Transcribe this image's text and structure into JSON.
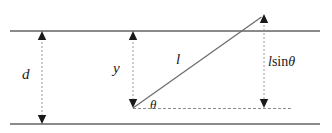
{
  "diagram": {
    "type": "geometry-diagram",
    "background_color": "#ffffff",
    "stroke_color": "#7a7a7a",
    "dashed_color": "#8c8c8c",
    "needle_color": "#6e6e6e",
    "text_color": "#1a1a1a",
    "labels": {
      "line_spacing": "d",
      "vertical_offset": "y",
      "needle_length": "l",
      "angle": "θ",
      "vertical_component_symbol": "l",
      "vertical_component_operator": "sin",
      "vertical_component_angle": "θ",
      "vertical_component": "l sin θ"
    },
    "elements": {
      "top_line": {
        "name": "top-parallel-line",
        "x1": 10,
        "y1": 31,
        "x2": 320,
        "y2": 31
      },
      "bottom_line": {
        "name": "bottom-parallel-line",
        "x1": 10,
        "y1": 124,
        "x2": 320,
        "y2": 124
      },
      "d_arrow": {
        "name": "distance-d-arrow",
        "x": 42,
        "y_top": 31,
        "y_bottom": 124
      },
      "y_arrow": {
        "name": "offset-y-arrow",
        "x": 133,
        "y_top": 31,
        "y_bottom": 108
      },
      "lsin_arrow": {
        "name": "l-sin-theta-arrow",
        "x": 264,
        "y_top": 14,
        "y_bottom": 108
      },
      "baseline": {
        "name": "horizontal-baseline",
        "x1": 133,
        "y1": 108,
        "x2": 292,
        "y2": 108
      },
      "needle": {
        "name": "needle-segment",
        "x1": 133,
        "y1": 108,
        "x2": 264,
        "y2": 15
      },
      "angle_arc": {
        "name": "theta-angle-arc",
        "vertex_x": 133,
        "vertex_y": 108
      }
    }
  }
}
